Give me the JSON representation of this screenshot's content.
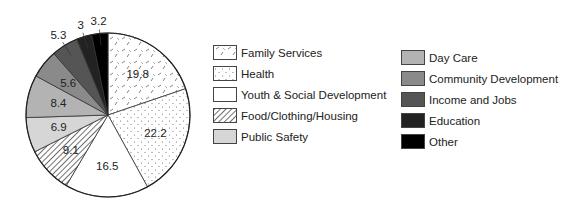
{
  "chart_data": {
    "type": "pie",
    "title": "",
    "start_angle": "12 o'clock",
    "direction": "clockwise",
    "unit": "percent",
    "slices": [
      {
        "label": "Family Services",
        "value": 19.8,
        "fill": "#ffffff",
        "pattern": "dashes"
      },
      {
        "label": "Health",
        "value": 22.2,
        "fill": "#ffffff",
        "pattern": "dots"
      },
      {
        "label": "Youth & Social Development",
        "value": 16.5,
        "fill": "#ffffff",
        "pattern": "none"
      },
      {
        "label": "Food/Clothing/Housing",
        "value": 9.1,
        "fill": "#ffffff",
        "pattern": "diagonal-hatch"
      },
      {
        "label": "Public Safety",
        "value": 6.9,
        "fill": "#d6d6d6",
        "pattern": "none"
      },
      {
        "label": "Day Care",
        "value": 8.4,
        "fill": "#b3b3b3",
        "pattern": "none"
      },
      {
        "label": "Community Development",
        "value": 5.6,
        "fill": "#8a8a8a",
        "pattern": "none"
      },
      {
        "label": "Income and Jobs",
        "value": 5.3,
        "fill": "#555555",
        "pattern": "none"
      },
      {
        "label": "Education",
        "value": 3,
        "fill": "#222222",
        "pattern": "none"
      },
      {
        "label": "Other",
        "value": 3.2,
        "fill": "#000000",
        "pattern": "none"
      }
    ],
    "data_labels": [
      "19.8",
      "22.2",
      "16.5",
      "9.1",
      "6.9",
      "8.4",
      "5.6",
      "5.3",
      "3",
      "3.2"
    ],
    "legend": {
      "position": "right",
      "columns": [
        [
          "Family Services",
          "Health",
          "Youth & Social Development",
          "Food/Clothing/Housing",
          "Public Safety"
        ],
        [
          "Day Care",
          "Community Development",
          "Income and Jobs",
          "Education",
          "Other"
        ]
      ]
    }
  },
  "legend": {
    "col1": [
      {
        "label": "Family Services"
      },
      {
        "label": "Health"
      },
      {
        "label": "Youth & Social Development"
      },
      {
        "label": "Food/Clothing/Housing"
      },
      {
        "label": "Public Safety"
      }
    ],
    "col2": [
      {
        "label": "Day Care"
      },
      {
        "label": "Community Development"
      },
      {
        "label": "Income and Jobs"
      },
      {
        "label": "Education"
      },
      {
        "label": "Other"
      }
    ]
  }
}
